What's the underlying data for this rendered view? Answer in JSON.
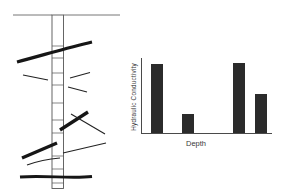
{
  "figure": {
    "background_color": "#ffffff",
    "ink_color": "#161616"
  },
  "borehole_diagram": {
    "description_name": "borehole-with-fractures-schematic",
    "thick_fracture_count": 4,
    "thin_fracture_count": 6
  },
  "chart_data": {
    "type": "bar",
    "title": "",
    "xlabel": "Depth",
    "ylabel": "Hydraulic Conductivity",
    "categories": [
      "fracture-zone-1",
      "fracture-zone-2",
      "fracture-zone-3",
      "fracture-zone-4"
    ],
    "values": [
      70,
      19,
      71,
      40
    ],
    "ylim": [
      0,
      76
    ],
    "units": "relative (no numeric scale shown)",
    "legend": "none",
    "grid": false,
    "layout": {
      "bar_centers_frac": [
        0.118,
        0.351,
        0.744,
        0.916
      ],
      "bar_width_px": 12,
      "bar_color": "#2b2b2b",
      "axis_color": "#4a4a4a"
    }
  }
}
